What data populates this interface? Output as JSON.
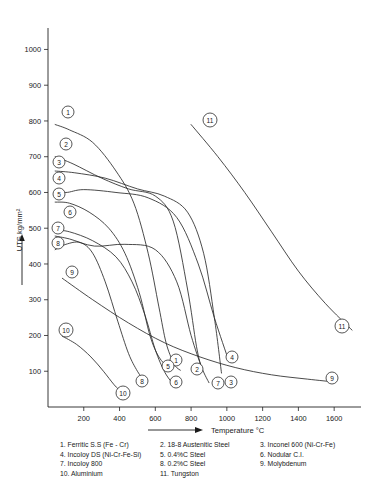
{
  "chart_data": {
    "type": "line",
    "title": "",
    "xlabel": "Temperature °C",
    "ylabel": "UTS kg/mm²",
    "xlim": [
      0,
      1750
    ],
    "ylim": [
      0,
      1060
    ],
    "xticks": [
      200,
      400,
      600,
      800,
      1000,
      1200,
      1400,
      1600
    ],
    "xtick_labels": [
      "200",
      "400",
      "600",
      "800",
      "1000",
      "1200",
      "1400",
      "1600"
    ],
    "yticks": [
      100,
      200,
      300,
      400,
      500,
      600,
      700,
      800,
      900,
      1000
    ],
    "ytick_labels": [
      "100",
      "200",
      "300",
      "400",
      "500",
      "600",
      "700",
      "800",
      "900",
      "1000"
    ],
    "grid": false,
    "legend_position": "below-axes",
    "series": [
      {
        "id": 1,
        "name": "Ferritic S.S (Fe - Cr)",
        "x": [
          40,
          120,
          250,
          380,
          480,
          560,
          620,
          660,
          700,
          720,
          740
        ],
        "y": [
          790,
          775,
          740,
          660,
          570,
          430,
          280,
          180,
          125,
          110,
          103
        ]
      },
      {
        "id": 2,
        "name": "18-8 Austenitic Steel",
        "x": [
          40,
          140,
          300,
          450,
          600,
          700,
          780,
          830,
          860
        ],
        "y": [
          700,
          680,
          640,
          610,
          590,
          520,
          330,
          170,
          105
        ]
      },
      {
        "id": 3,
        "name": "Inconel 600 (Ni-Cr-Fe)",
        "x": [
          40,
          150,
          320,
          500,
          650,
          780,
          870,
          930,
          970
        ],
        "y": [
          660,
          655,
          640,
          610,
          590,
          545,
          430,
          250,
          95
        ]
      },
      {
        "id": 4,
        "name": "Incoloy DS (Ni-Cr-Fe-Si)",
        "x": [
          40,
          100,
          200,
          380,
          560,
          720,
          840,
          930,
          1010
        ],
        "y": [
          608,
          600,
          608,
          600,
          585,
          530,
          400,
          250,
          130
        ]
      },
      {
        "id": 5,
        "name": "0.4%C Steel",
        "x": [
          40,
          120,
          230,
          340,
          430,
          510,
          570,
          620,
          670
        ],
        "y": [
          573,
          570,
          545,
          500,
          430,
          320,
          200,
          140,
          112
        ]
      },
      {
        "id": 6,
        "name": "Nodular C.I.",
        "x": [
          40,
          120,
          250,
          380,
          470,
          540,
          600,
          650,
          690
        ],
        "y": [
          495,
          490,
          465,
          420,
          350,
          260,
          160,
          100,
          70
        ]
      },
      {
        "id": 7,
        "name": "Incoloy 800",
        "x": [
          40,
          120,
          260,
          430,
          600,
          720,
          800,
          860,
          900
        ],
        "y": [
          478,
          470,
          450,
          455,
          440,
          350,
          200,
          110,
          68
        ]
      },
      {
        "id": 8,
        "name": "0.2%C Steel",
        "x": [
          40,
          100,
          180,
          250,
          320,
          390,
          450,
          500,
          540
        ],
        "y": [
          440,
          455,
          460,
          430,
          350,
          240,
          150,
          100,
          72
        ]
      },
      {
        "id": 9,
        "name": "Molybdenum",
        "x": [
          80,
          250,
          450,
          650,
          850,
          1050,
          1250,
          1450,
          1600
        ],
        "y": [
          360,
          300,
          235,
          180,
          140,
          110,
          90,
          78,
          70
        ]
      },
      {
        "id": 10,
        "name": "Aluminium",
        "x": [
          80,
          160,
          240,
          310,
          370,
          410
        ],
        "y": [
          198,
          175,
          140,
          100,
          62,
          42
        ]
      },
      {
        "id": 11,
        "name": "Tungston",
        "x": [
          800,
          950,
          1100,
          1250,
          1400,
          1550,
          1700
        ],
        "y": [
          790,
          700,
          600,
          490,
          380,
          290,
          215
        ]
      }
    ],
    "point_markers": [
      {
        "label": "1",
        "px": 68,
        "py": 112
      },
      {
        "label": "2",
        "px": 66,
        "py": 144
      },
      {
        "label": "3",
        "px": 59,
        "py": 162
      },
      {
        "label": "4",
        "px": 59,
        "py": 178
      },
      {
        "label": "5",
        "px": 59,
        "py": 194
      },
      {
        "label": "6",
        "px": 70,
        "py": 212
      },
      {
        "label": "7",
        "px": 58,
        "py": 228
      },
      {
        "label": "8",
        "px": 58,
        "py": 243
      },
      {
        "label": "9",
        "px": 72,
        "py": 272
      },
      {
        "label": "10",
        "px": 66,
        "py": 330
      },
      {
        "label": "11",
        "px": 210,
        "py": 120
      },
      {
        "label": "1",
        "px": 176,
        "py": 360
      },
      {
        "label": "2",
        "px": 197,
        "py": 369
      },
      {
        "label": "3",
        "px": 231,
        "py": 382
      },
      {
        "label": "4",
        "px": 232,
        "py": 357
      },
      {
        "label": "5",
        "px": 168,
        "py": 366
      },
      {
        "label": "6",
        "px": 176,
        "py": 382
      },
      {
        "label": "7",
        "px": 218,
        "py": 383
      },
      {
        "label": "8",
        "px": 142,
        "py": 381
      },
      {
        "label": "9",
        "px": 332,
        "py": 378
      },
      {
        "label": "10",
        "px": 123,
        "py": 393
      },
      {
        "label": "11",
        "px": 342,
        "py": 326
      }
    ]
  },
  "axes": {
    "y_axis_title": "UTS kg/mm²",
    "x_axis_title": "Temperature °C"
  },
  "legend": {
    "rows": [
      [
        {
          "num": "1.",
          "text": "Ferritic S.S (Fe - Cr)"
        },
        {
          "num": "2.",
          "text": "18-8 Austenitic Steel"
        },
        {
          "num": "3.",
          "text": "Inconel 600 (Ni-Cr-Fe)"
        }
      ],
      [
        {
          "num": "4.",
          "text": "Incoloy DS (Ni-Cr-Fe-Si)"
        },
        {
          "num": "5.",
          "text": "0.4%C Steel"
        },
        {
          "num": "6.",
          "text": "Nodular C.I."
        }
      ],
      [
        {
          "num": "7.",
          "text": "Incoloy 800"
        },
        {
          "num": "8.",
          "text": "0.2%C Steel"
        },
        {
          "num": "9.",
          "text": "Molybdenum"
        }
      ],
      [
        {
          "num": "10.",
          "text": "Aluminium"
        },
        {
          "num": "11.",
          "text": "Tungston"
        },
        {
          "num": "",
          "text": ""
        }
      ]
    ],
    "entries": [
      "1. Ferritic S.S (Fe - Cr)",
      "2. 18-8 Austenitic Steel",
      "3. Inconel 600 (Ni-Cr-Fe)",
      "4. Incoloy DS (Ni-Cr-Fe-Si)",
      "5. 0.4%C Steel",
      "6. Nodular C.I.",
      "7. Incoloy 800",
      "8. 0.2%C Steel",
      "9. Molybdenum",
      "10. Aluminium",
      "11. Tungston"
    ]
  },
  "colors": {
    "ink": "#2b2b2b",
    "background": "#ffffff"
  }
}
